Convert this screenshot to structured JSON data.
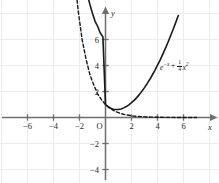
{
  "chart_data": {
    "type": "line",
    "title": "",
    "xlabel": "x",
    "ylabel": "y",
    "xlim": [
      -7.2,
      7.6
    ],
    "ylim": [
      -5.1,
      8.2
    ],
    "grid": true,
    "grid_spacing": 2,
    "legend_position": "inline-right",
    "origin_label": "O",
    "xticks": [
      -6,
      -4,
      -2,
      2,
      4,
      6
    ],
    "xtick_labels": [
      "−6",
      "−4",
      "−2",
      "2",
      "4",
      "6"
    ],
    "yticks": [
      6,
      4,
      2,
      -2,
      -4
    ],
    "ytick_labels": [
      "6",
      "4",
      "2",
      "−2",
      "−4"
    ],
    "annotations": [
      {
        "name": "curve-equation-label",
        "text": "e−x + 1/4 x2",
        "base": "e",
        "exponent": "−x",
        "plus": "+",
        "frac_numerator": "1",
        "frac_denominator": "4",
        "var": "x",
        "var_exponent": "2",
        "x": 3.8,
        "y": 4.0
      }
    ],
    "series": [
      {
        "name": "e^{-x} + (1/4)x^2",
        "style": "solid",
        "color": "#1a1a1a",
        "width": 1.6,
        "x": [
          -5.4,
          -5.2,
          -5.0,
          -4.8,
          -4.6,
          -4.4,
          -4.2,
          -4.0,
          -3.8,
          -3.6,
          -3.4,
          -3.2,
          -3.0,
          -2.8,
          -2.6,
          -2.4,
          -2.2,
          -2.0,
          -1.8,
          -1.6,
          -1.4,
          -1.2,
          -1.0,
          -0.8,
          -0.6,
          -0.4,
          -0.2,
          0.0,
          0.2,
          0.4,
          0.6,
          0.8,
          1.0,
          1.2,
          1.4,
          1.6,
          1.8,
          2.0,
          2.2,
          2.4,
          2.6,
          2.8,
          3.0,
          3.2,
          3.4,
          3.6,
          3.8,
          4.0,
          4.2,
          4.4,
          4.6,
          4.8,
          5.0,
          5.2,
          5.4,
          5.6
        ],
        "y": [
          228.6,
          188.1,
          155.0,
          128.3,
          106.4,
          88.3,
          73.5,
          61.6,
          51.7,
          43.7,
          37.0,
          31.6,
          27.3,
          23.4,
          20.2,
          17.5,
          15.3,
          13.4,
          11.9,
          10.6,
          9.5,
          8.7,
          8.0,
          7.4,
          7.0,
          6.5,
          6.2,
          1.0,
          0.83,
          0.71,
          0.64,
          0.61,
          0.62,
          0.66,
          0.74,
          0.84,
          0.97,
          1.14,
          1.32,
          1.53,
          1.76,
          2.02,
          2.3,
          2.6,
          2.92,
          3.27,
          3.63,
          4.02,
          4.42,
          4.85,
          5.3,
          5.77,
          6.27,
          6.77,
          7.3,
          7.84
        ]
      },
      {
        "name": "e^{-x}",
        "style": "dashed",
        "color": "#1a1a1a",
        "width": 1.4,
        "x": [
          -5.7,
          -5.4,
          -5.1,
          -4.8,
          -4.5,
          -4.2,
          -3.9,
          -3.6,
          -3.3,
          -3.0,
          -2.7,
          -2.4,
          -2.1,
          -1.8,
          -1.5,
          -1.2,
          -0.9,
          -0.6,
          -0.3,
          0.0,
          0.3,
          0.6,
          0.9,
          1.2,
          1.5,
          1.8,
          2.1,
          2.4,
          2.7,
          3.0,
          3.5,
          4.0,
          4.5,
          5.0,
          5.5,
          6.0,
          6.5,
          7.0
        ],
        "y": [
          298.9,
          221.4,
          164.0,
          121.5,
          90.0,
          66.7,
          49.4,
          36.6,
          27.1,
          20.1,
          14.9,
          11.0,
          8.2,
          6.0,
          4.5,
          3.3,
          2.5,
          1.8,
          1.35,
          1.0,
          0.74,
          0.55,
          0.41,
          0.3,
          0.22,
          0.17,
          0.12,
          0.09,
          0.07,
          0.05,
          0.03,
          0.02,
          0.01,
          0.007,
          0.004,
          0.002,
          0.0015,
          0.0009
        ]
      }
    ]
  }
}
